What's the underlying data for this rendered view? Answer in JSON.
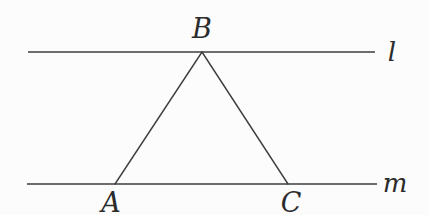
{
  "diagram": {
    "background_color": "#fcfcfc",
    "stroke_color": "#3e3e3e",
    "label_color": "#2b2b2b",
    "labels": {
      "line_l": "l",
      "line_m": "m",
      "vertex_A": "A",
      "vertex_B": "B",
      "vertex_C": "C"
    },
    "elements": {
      "lines": [
        {
          "name": "l",
          "orientation": "horizontal",
          "position": "top",
          "label_side": "right"
        },
        {
          "name": "m",
          "orientation": "horizontal",
          "position": "bottom",
          "label_side": "right"
        }
      ],
      "triangle": {
        "vertices": [
          "A",
          "B",
          "C"
        ],
        "B_on_line": "l",
        "A_on_line": "m",
        "C_on_line": "m"
      }
    }
  }
}
